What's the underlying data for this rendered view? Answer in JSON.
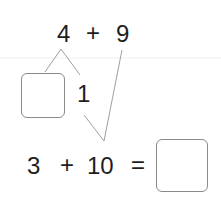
{
  "diagram": {
    "type": "number-bond-addition",
    "top_expression": {
      "left": "4",
      "operator": "+",
      "right": "9"
    },
    "split": {
      "blank_box": "",
      "part": "1"
    },
    "bottom_equation": {
      "left": "3",
      "operator": "+",
      "right": "10",
      "equals": "=",
      "answer_box": ""
    },
    "colors": {
      "text": "#1e1e1e",
      "lines": "#9a9a9a",
      "box_border": "#8a8a8a"
    }
  }
}
